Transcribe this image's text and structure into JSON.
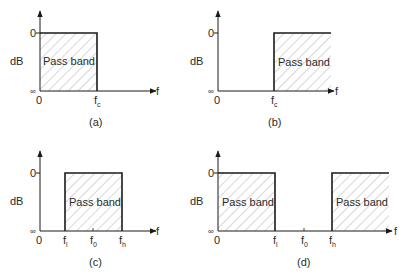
{
  "figure": {
    "panels": [
      {
        "id": "a",
        "caption": "(a)",
        "filter_type": "low-pass",
        "y_label": "dB",
        "y_top_tick": "0",
        "y_bottom_tick": "∞",
        "x_origin": "0",
        "x_axis_label": "f",
        "x_ticks": [
          {
            "base": "f",
            "sub": "c"
          }
        ],
        "bands": [
          {
            "label": "Pass band"
          }
        ]
      },
      {
        "id": "b",
        "caption": "(b)",
        "filter_type": "high-pass",
        "y_label": "dB",
        "y_top_tick": "0",
        "y_bottom_tick": "∞",
        "x_origin": "0",
        "x_axis_label": "f",
        "x_ticks": [
          {
            "base": "f",
            "sub": "c"
          }
        ],
        "bands": [
          {
            "label": "Pass band"
          }
        ]
      },
      {
        "id": "c",
        "caption": "(c)",
        "filter_type": "band-pass",
        "y_label": "dB",
        "y_top_tick": "0",
        "y_bottom_tick": "∞",
        "x_origin": "0",
        "x_axis_label": "f",
        "x_ticks": [
          {
            "base": "f",
            "sub": "l"
          },
          {
            "base": "f",
            "sub": "0"
          },
          {
            "base": "f",
            "sub": "h"
          }
        ],
        "bands": [
          {
            "label": "Pass band"
          }
        ]
      },
      {
        "id": "d",
        "caption": "(d)",
        "filter_type": "band-stop",
        "y_label": "dB",
        "y_top_tick": "0",
        "y_bottom_tick": "∞",
        "x_origin": "0",
        "x_axis_label": "f",
        "x_ticks": [
          {
            "base": "f",
            "sub": "l"
          },
          {
            "base": "f",
            "sub": "0"
          },
          {
            "base": "f",
            "sub": "h"
          }
        ],
        "bands": [
          {
            "label": "Pass band"
          },
          {
            "label": "Pass band"
          }
        ]
      }
    ],
    "colors": {
      "line": "#1a1a1a",
      "hatch": "#8a8a8a",
      "text": "#2a2a2a"
    }
  }
}
